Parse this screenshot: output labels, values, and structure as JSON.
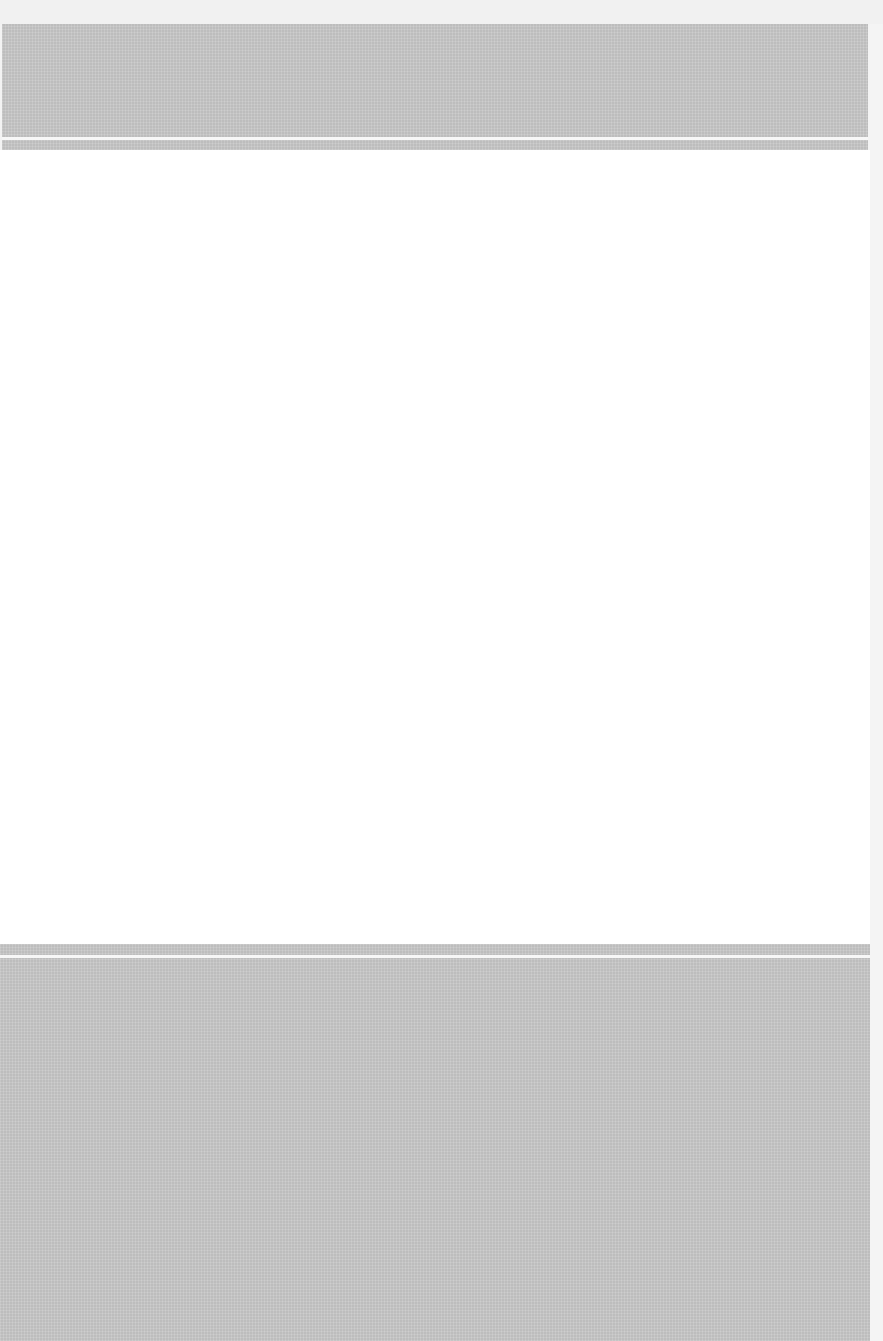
{
  "document": {
    "colors": {
      "background": "#f3f3f3",
      "band": "#c9c9c9",
      "band_line": "#f7f7f7",
      "page": "#ffffff"
    }
  }
}
